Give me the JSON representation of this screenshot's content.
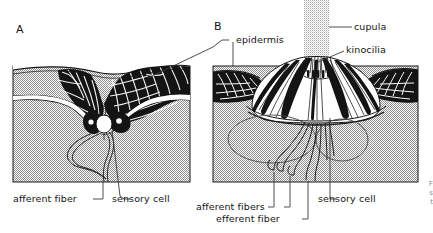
{
  "figure": {
    "panels": [
      {
        "id": "A",
        "name": "pit-organ",
        "description": "Sensory pit with sensory cell and afferent fiber"
      },
      {
        "id": "B",
        "name": "neuromast-with-cupula",
        "description": "Neuromast organ with cupula, kinocilia, afferent and efferent fibers"
      }
    ],
    "labels": {
      "panel_a": "A",
      "panel_b": "B",
      "cupula": "cupula",
      "epidermis": "epidermis",
      "kinocilia": "kinocilia",
      "afferent_fiber": "afferent fiber",
      "sensory_cell_a": "sensory cell",
      "afferent_fibers": "afferent fibers",
      "efferent_fiber": "efferent fiber",
      "sensory_cell_b": "sensory cell"
    },
    "caption_fragment": {
      "line1": "F",
      "line2": "s",
      "line3": "t"
    },
    "colors": {
      "ink": "#141414",
      "tissue_fill": "#c9c9c9",
      "cupula_fill": "#d2d2d2",
      "leader_line": "#3a3a3a",
      "background": "#ffffff"
    }
  }
}
